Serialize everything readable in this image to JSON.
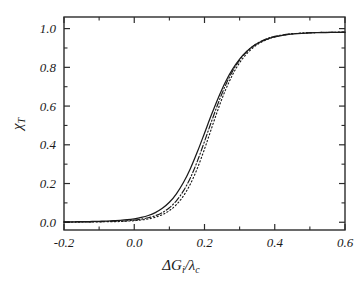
{
  "figure": {
    "background": "#ffffff",
    "foreground": "#1a1a1a",
    "frame_color": "#2b2b2b"
  },
  "axes": {
    "x_title_parts": {
      "delta": "Δ",
      "g": "G",
      "g_sub": "i",
      "slash": "/",
      "lambda": "λ",
      "lambda_sub": "c"
    },
    "y_title_parts": {
      "chi": "χ",
      "chi_sub": "T"
    },
    "x_tick_labels": [
      "-0.2",
      "0.0",
      "0.2",
      "0.4",
      "0.6"
    ],
    "y_tick_labels": [
      "0.0",
      "0.2",
      "0.4",
      "0.6",
      "0.8",
      "1.0"
    ]
  },
  "chart_data": {
    "type": "line",
    "title": "",
    "xlabel": "ΔG_i/λ_c",
    "ylabel": "χ_T",
    "xlim": [
      -0.2,
      0.6
    ],
    "ylim": [
      -0.04,
      1.06
    ],
    "xticks": [
      -0.2,
      0.0,
      0.2,
      0.4,
      0.6
    ],
    "yticks": [
      0.0,
      0.2,
      0.4,
      0.6,
      0.8,
      1.0
    ],
    "xminorticks": [
      -0.1,
      0.1,
      0.3,
      0.5
    ],
    "yminorticks": [
      0.1,
      0.3,
      0.5,
      0.7,
      0.9
    ],
    "grid": false,
    "legend": false,
    "tick_direction": "in",
    "series": [
      {
        "name": "solid",
        "style": "solid",
        "color": "#1a1a1a",
        "x": [
          -0.2,
          -0.18,
          -0.16,
          -0.14,
          -0.12,
          -0.1,
          -0.08,
          -0.06,
          -0.04,
          -0.02,
          0.0,
          0.02,
          0.04,
          0.06,
          0.08,
          0.1,
          0.12,
          0.14,
          0.16,
          0.18,
          0.2,
          0.22,
          0.24,
          0.26,
          0.28,
          0.3,
          0.32,
          0.34,
          0.36,
          0.38,
          0.4,
          0.44,
          0.48,
          0.52,
          0.56,
          0.6
        ],
        "y": [
          0.002,
          0.002,
          0.003,
          0.003,
          0.004,
          0.005,
          0.006,
          0.008,
          0.01,
          0.013,
          0.018,
          0.025,
          0.035,
          0.05,
          0.072,
          0.103,
          0.147,
          0.205,
          0.278,
          0.365,
          0.46,
          0.556,
          0.646,
          0.726,
          0.791,
          0.843,
          0.882,
          0.911,
          0.932,
          0.947,
          0.957,
          0.97,
          0.976,
          0.979,
          0.98,
          0.981
        ]
      },
      {
        "name": "dash-dot",
        "style": "dashdot",
        "color": "#1a1a1a",
        "x": [
          -0.2,
          -0.18,
          -0.16,
          -0.14,
          -0.12,
          -0.1,
          -0.08,
          -0.06,
          -0.04,
          -0.02,
          0.0,
          0.02,
          0.04,
          0.06,
          0.08,
          0.1,
          0.12,
          0.14,
          0.16,
          0.18,
          0.2,
          0.22,
          0.24,
          0.26,
          0.28,
          0.3,
          0.32,
          0.34,
          0.36,
          0.38,
          0.4,
          0.44,
          0.48,
          0.52,
          0.56,
          0.6
        ],
        "y": [
          0.001,
          0.001,
          0.002,
          0.002,
          0.002,
          0.003,
          0.004,
          0.005,
          0.006,
          0.008,
          0.011,
          0.016,
          0.023,
          0.034,
          0.05,
          0.075,
          0.111,
          0.162,
          0.23,
          0.317,
          0.417,
          0.521,
          0.62,
          0.708,
          0.78,
          0.838,
          0.881,
          0.912,
          0.934,
          0.95,
          0.96,
          0.972,
          0.977,
          0.98,
          0.981,
          0.982
        ]
      },
      {
        "name": "dotted",
        "style": "dotted",
        "color": "#1a1a1a",
        "x": [
          -0.2,
          -0.18,
          -0.16,
          -0.14,
          -0.12,
          -0.1,
          -0.08,
          -0.06,
          -0.04,
          -0.02,
          0.0,
          0.02,
          0.04,
          0.06,
          0.08,
          0.1,
          0.12,
          0.14,
          0.16,
          0.18,
          0.2,
          0.22,
          0.24,
          0.26,
          0.28,
          0.3,
          0.32,
          0.34,
          0.36,
          0.38,
          0.4,
          0.44,
          0.48,
          0.52,
          0.56,
          0.6
        ],
        "y": [
          0.001,
          0.001,
          0.001,
          0.001,
          0.002,
          0.002,
          0.003,
          0.003,
          0.004,
          0.006,
          0.008,
          0.012,
          0.017,
          0.026,
          0.039,
          0.06,
          0.091,
          0.136,
          0.198,
          0.28,
          0.378,
          0.485,
          0.59,
          0.684,
          0.762,
          0.824,
          0.87,
          0.904,
          0.928,
          0.945,
          0.957,
          0.971,
          0.977,
          0.98,
          0.981,
          0.982
        ]
      }
    ]
  }
}
